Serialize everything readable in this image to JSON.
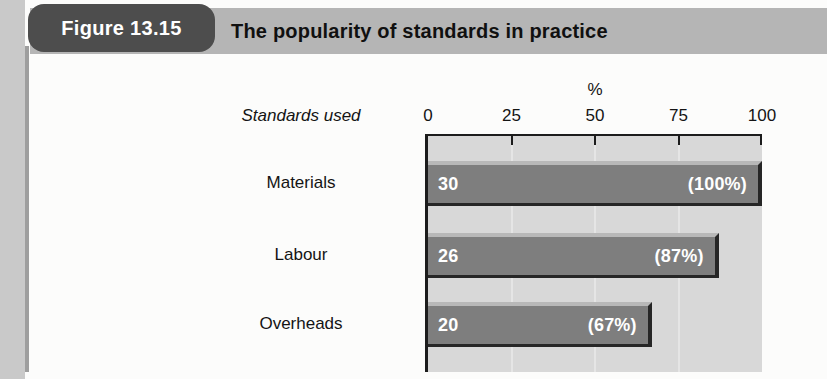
{
  "header": {
    "figure_label": "Figure 13.15",
    "title": "The popularity of standards in practice"
  },
  "chart_data": {
    "type": "bar",
    "orientation": "horizontal",
    "title": "The popularity of standards in practice",
    "ylabel": "Standards used",
    "xlabel": "%",
    "xlim": [
      0,
      100
    ],
    "xticks": [
      "0",
      "25",
      "50",
      "75",
      "100"
    ],
    "grid": true,
    "legend_position": "none",
    "categories": [
      "Materials",
      "Labour",
      "Overheads"
    ],
    "values": [
      30,
      26,
      20
    ],
    "bars": [
      {
        "label": "Materials",
        "value": "30",
        "percent": 100,
        "percent_label": "(100%)"
      },
      {
        "label": "Labour",
        "value": "26",
        "percent": 87,
        "percent_label": "(87%)"
      },
      {
        "label": "Overheads",
        "value": "20",
        "percent": 67,
        "percent_label": "(67%)"
      }
    ]
  },
  "colors": {
    "title_bar_bg": "#b5b5b5",
    "figure_pill_bg": "#4d4d4d",
    "figure_pill_text": "#ffffff",
    "plot_bg": "#d8d8d8",
    "bar_fill": "#7e7e7e",
    "bar_highlight": "#b8b8b8",
    "bar_shadow": "#262626",
    "bar_text": "#ffffff",
    "axis_line": "#1c1c1c",
    "gridline": "#e5e5e5"
  }
}
